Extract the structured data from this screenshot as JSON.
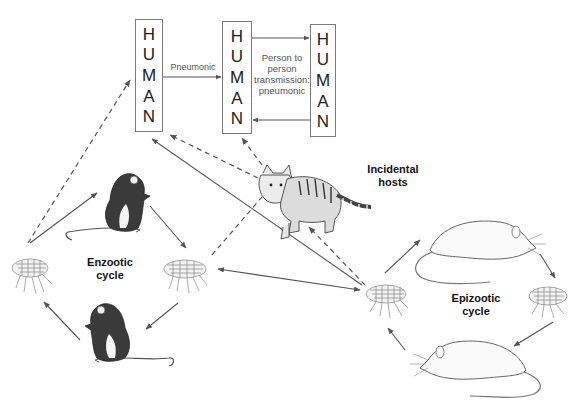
{
  "diagram": {
    "type": "plague transmission cycle",
    "humans": [
      {
        "id": "human-1",
        "letters": [
          "H",
          "U",
          "M",
          "A",
          "N"
        ]
      },
      {
        "id": "human-2",
        "letters": [
          "H",
          "U",
          "M",
          "A",
          "N"
        ]
      },
      {
        "id": "human-3",
        "letters": [
          "H",
          "U",
          "M",
          "A",
          "N"
        ]
      }
    ],
    "labels": {
      "pneumonic": "Pneumonic",
      "person_to_person": [
        "Person to",
        "person",
        "transmission:",
        "pneumonic"
      ],
      "incidental_hosts": [
        "Incidental",
        "hosts"
      ],
      "enzootic_cycle": [
        "Enzootic",
        "cycle"
      ],
      "epizootic_cycle": [
        "Epizootic",
        "cycle"
      ]
    },
    "nodes": [
      {
        "id": "flea-enzootic-left",
        "kind": "flea"
      },
      {
        "id": "mouse-enzootic-top",
        "kind": "rodent"
      },
      {
        "id": "flea-enzootic-right",
        "kind": "flea"
      },
      {
        "id": "mouse-enzootic-bottom",
        "kind": "rodent"
      },
      {
        "id": "cat",
        "kind": "incidental host"
      },
      {
        "id": "flea-epizootic-left",
        "kind": "flea"
      },
      {
        "id": "rat-epizootic-top",
        "kind": "rodent"
      },
      {
        "id": "flea-epizootic-right",
        "kind": "flea"
      },
      {
        "id": "rat-epizootic-bottom",
        "kind": "rodent"
      }
    ],
    "edges": [
      {
        "from": "human-1",
        "to": "human-2",
        "style": "solid",
        "label": "Pneumonic"
      },
      {
        "from": "human-2",
        "to": "human-3",
        "style": "solid"
      },
      {
        "from": "human-3",
        "to": "human-2",
        "style": "solid"
      },
      {
        "from": "flea-enzootic-left",
        "to": "human-1",
        "style": "dashed"
      },
      {
        "from": "flea-enzootic-left",
        "to": "mouse-enzootic-top",
        "style": "solid"
      },
      {
        "from": "mouse-enzootic-top",
        "to": "flea-enzootic-right",
        "style": "solid"
      },
      {
        "from": "flea-enzootic-right",
        "to": "mouse-enzootic-bottom",
        "style": "solid"
      },
      {
        "from": "mouse-enzootic-bottom",
        "to": "flea-enzootic-left",
        "style": "solid"
      },
      {
        "from": "flea-enzootic-right",
        "to": "cat",
        "style": "dashed"
      },
      {
        "from": "cat",
        "to": "human-1",
        "style": "dashed"
      },
      {
        "from": "cat",
        "to": "human-2",
        "style": "dashed"
      },
      {
        "from": "flea-epizootic-left",
        "to": "human-1",
        "style": "solid"
      },
      {
        "from": "flea-epizootic-left",
        "to": "flea-enzootic-right",
        "style": "solid",
        "bidirectional": true
      },
      {
        "from": "flea-epizootic-left",
        "to": "cat",
        "style": "dashed"
      },
      {
        "from": "flea-epizootic-left",
        "to": "rat-epizootic-top",
        "style": "solid"
      },
      {
        "from": "rat-epizootic-top",
        "to": "flea-epizootic-right",
        "style": "solid"
      },
      {
        "from": "flea-epizootic-right",
        "to": "rat-epizootic-bottom",
        "style": "solid"
      },
      {
        "from": "rat-epizootic-bottom",
        "to": "flea-epizootic-left",
        "style": "solid"
      }
    ],
    "colors": {
      "line": "#555555",
      "box_border": "#7a7a7a",
      "text": "#222222"
    }
  }
}
